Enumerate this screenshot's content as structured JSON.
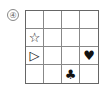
{
  "puzzle_label": "④",
  "grid": {
    "rows": 4,
    "cols": 4,
    "cells": [
      [
        "",
        "",
        "",
        ""
      ],
      [
        "☆",
        "",
        "",
        ""
      ],
      [
        "▷",
        "",
        "",
        "♥"
      ],
      [
        "",
        "",
        "♣",
        ""
      ]
    ]
  }
}
